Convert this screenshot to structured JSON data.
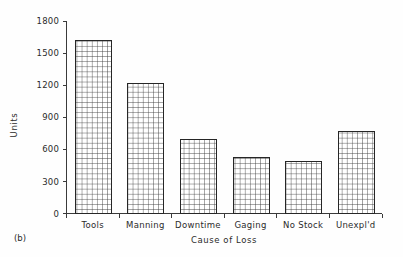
{
  "figure": {
    "panel_caption": "(b)",
    "background_color": "#fefefe",
    "ink_color": "#262626"
  },
  "chart_data": {
    "type": "bar",
    "title": "",
    "subtitle": "",
    "xlabel": "Cause of Loss",
    "ylabel": "Units",
    "categories": [
      "Tools",
      "Manning",
      "Downtime",
      "Gaging",
      "No Stock",
      "Unexpl'd"
    ],
    "values": [
      1620,
      1220,
      700,
      530,
      490,
      770
    ],
    "ylim": [
      0,
      1800
    ],
    "yticks": [
      0,
      300,
      600,
      900,
      1200,
      1500,
      1800
    ],
    "ytick_labels": [
      "0",
      "300",
      "600",
      "900",
      "1200",
      "1500",
      "1800"
    ],
    "grid": false,
    "bar_pattern": "cross-hatch-grid",
    "bar_fill_color": "#ffffff",
    "bar_edge_color": "#262626",
    "legend": null,
    "legend_position": "none",
    "annotations": []
  }
}
